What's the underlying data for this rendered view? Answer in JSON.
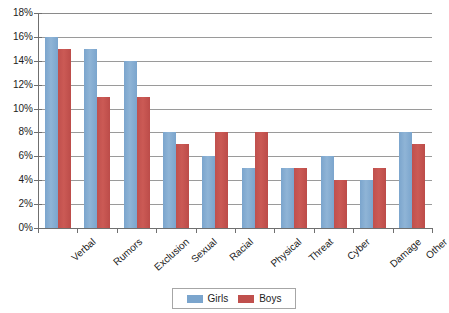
{
  "chart_data": {
    "type": "bar",
    "title": "",
    "subtitle": "",
    "xlabel": "",
    "ylabel": "",
    "ylim": [
      0,
      18
    ],
    "y_tick_labels": [
      "18%",
      "16%",
      "14%",
      "12%",
      "10%",
      "8%",
      "6%",
      "4%",
      "2%",
      "0%"
    ],
    "y_tick_values": [
      18,
      16,
      14,
      12,
      10,
      8,
      6,
      4,
      2,
      0
    ],
    "grid": true,
    "legend_position": "bottom",
    "categories": [
      "Verbal",
      "Rumors",
      "Exclusion",
      "Sexual",
      "Racial",
      "Physical",
      "Threat",
      "Cyber",
      "Damage",
      "Other"
    ],
    "series": [
      {
        "name": "Girls",
        "color": "#7ba5cd",
        "values": [
          16,
          15,
          14,
          8,
          6,
          5,
          5,
          6,
          4,
          8
        ]
      },
      {
        "name": "Boys",
        "color": "#c0504d",
        "values": [
          15,
          11,
          11,
          7,
          8,
          8,
          5,
          4,
          5,
          7
        ]
      }
    ]
  },
  "legend": {
    "entries": [
      {
        "label": "Girls",
        "swatch": "girls-swatch"
      },
      {
        "label": "Boys",
        "swatch": "boys-swatch"
      }
    ]
  },
  "colors": {
    "girls": "#7ba5cd",
    "boys": "#c0504d",
    "gridline": "#9a9a9a",
    "axis": "#6f6f6f",
    "background": "#ffffff"
  }
}
